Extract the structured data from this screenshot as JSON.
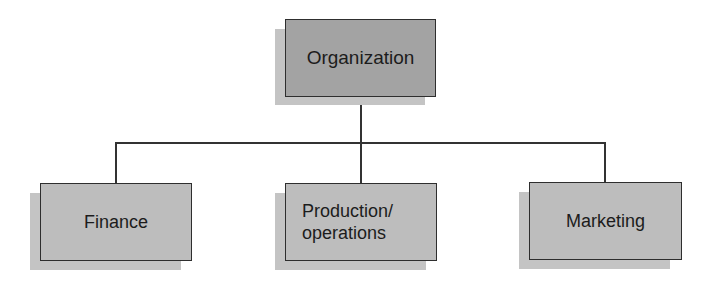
{
  "diagram": {
    "type": "org-chart",
    "root": {
      "id": "organization",
      "label": "Organization"
    },
    "children": [
      {
        "id": "finance",
        "label": "Finance"
      },
      {
        "id": "production-operations",
        "label": "Production/\noperations"
      },
      {
        "id": "marketing",
        "label": "Marketing"
      }
    ],
    "edges": [
      {
        "from": "organization",
        "to": "finance"
      },
      {
        "from": "organization",
        "to": "production-operations"
      },
      {
        "from": "organization",
        "to": "marketing"
      }
    ],
    "colors": {
      "root_fill": "#a3a3a3",
      "child_fill": "#bdbdbd",
      "shadow": "#c4c4c4",
      "border": "#2e2e2e",
      "connector": "#333333"
    }
  }
}
